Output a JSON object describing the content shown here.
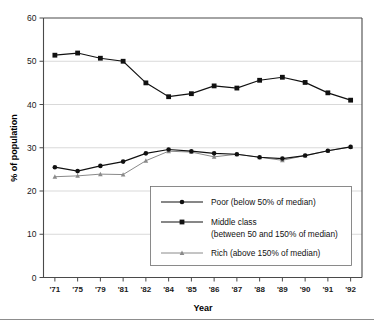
{
  "chart_data": {
    "type": "line",
    "title": "",
    "subtitle": "",
    "xlabel": "Year",
    "ylabel": "% of population",
    "categories": [
      "'71",
      "'75",
      "'79",
      "'81",
      "'82",
      "'84",
      "'85",
      "'86",
      "'87",
      "'88",
      "'89",
      "'90",
      "'91",
      "'92"
    ],
    "ylim": [
      0,
      60
    ],
    "yticks": [
      0,
      10,
      20,
      30,
      40,
      50,
      60
    ],
    "ytick_labels": [
      "0",
      "10",
      "20",
      "30",
      "40",
      "50",
      "60"
    ],
    "grid": "horizontal",
    "legend_position": "inside-bottom-right",
    "series": [
      {
        "name": "Poor (below 50% of median)",
        "marker": "circle",
        "color": "#111111",
        "values": [
          25.5,
          24.6,
          25.8,
          26.8,
          28.7,
          29.6,
          29.2,
          28.7,
          28.5,
          27.8,
          27.5,
          28.2,
          29.3,
          30.2
        ]
      },
      {
        "name": "Middle class (between 50 and 150% of median)",
        "marker": "square",
        "color": "#111111",
        "values": [
          51.4,
          51.9,
          50.7,
          50.0,
          45.0,
          41.8,
          42.5,
          44.3,
          43.8,
          45.6,
          46.3,
          45.1,
          42.7,
          41.0
        ]
      },
      {
        "name": "Rich (above 150% of median)",
        "marker": "triangle",
        "color": "#8a8a8a",
        "values": [
          23.3,
          23.5,
          23.9,
          23.8,
          27.0,
          29.2,
          29.0,
          27.9,
          28.5,
          27.8,
          27.1,
          28.2,
          29.3,
          30.2
        ]
      }
    ]
  },
  "legend": {
    "entries": [
      {
        "label_line1": "Poor (below 50% of median)",
        "label_line2": "",
        "marker": "circle",
        "color": "#111111"
      },
      {
        "label_line1": "Middle class",
        "label_line2": "(between 50 and 150% of median)",
        "marker": "square",
        "color": "#111111"
      },
      {
        "label_line1": "Rich (above 150% of median)",
        "label_line2": "",
        "marker": "triangle",
        "color": "#8a8a8a"
      }
    ]
  },
  "axes": {
    "x_title": "Year",
    "y_title": "% of population"
  }
}
